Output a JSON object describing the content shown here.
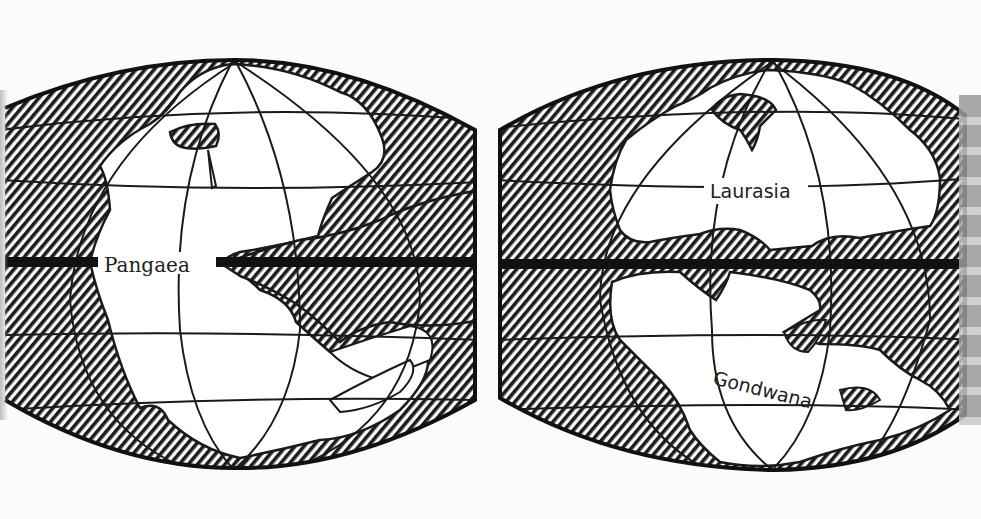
{
  "figure": {
    "type": "paleogeographic-maps",
    "panels": [
      {
        "id": "left",
        "label": "Pangaea",
        "description": "Single supercontinent on globe projection"
      },
      {
        "id": "right",
        "labels": [
          "Laurasia",
          "Gondwana"
        ],
        "description": "Supercontinent split into northern and southern landmasses"
      }
    ],
    "equator": "thick horizontal band across both maps",
    "ocean_fill": "diagonal hatching",
    "colors": {
      "ink": "#1a1a1a",
      "paper": "#fbfbfb",
      "land": "#ffffff"
    }
  }
}
